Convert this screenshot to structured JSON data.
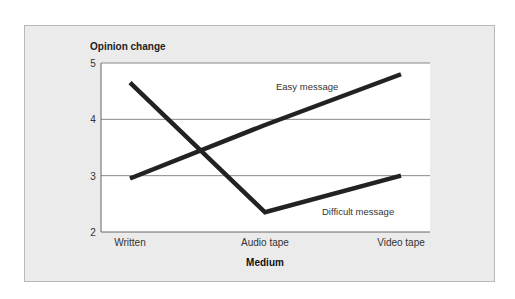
{
  "chart_data": {
    "type": "line",
    "title": "",
    "ylabel": "Opinion change",
    "xlabel": "Medium",
    "categories": [
      "Written",
      "Audio tape",
      "Video tape"
    ],
    "ylim": [
      2,
      5
    ],
    "yticks": [
      2,
      3,
      4,
      5
    ],
    "grid": "horizontal",
    "legend": "inline labels",
    "series": [
      {
        "name": "Easy message",
        "values": [
          2.95,
          3.9,
          4.8
        ]
      },
      {
        "name": "Difficult message",
        "values": [
          4.65,
          2.35,
          3.0
        ]
      }
    ]
  },
  "colors": {
    "panel_bg": "#ebebeb",
    "plot_bg": "#ffffff",
    "line": "#222222",
    "grid": "#888888"
  }
}
